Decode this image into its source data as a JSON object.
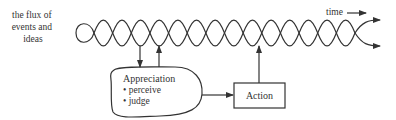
{
  "diagram": {
    "flux_label_lines": [
      "the flux of",
      "events and",
      "ideas"
    ],
    "time_label": "time",
    "appreciation": {
      "title": "Appreciation",
      "bullets": [
        "perceive",
        "judge"
      ]
    },
    "action_label": "Action",
    "colors": {
      "stroke": "#333333",
      "background": "#ffffff"
    }
  }
}
